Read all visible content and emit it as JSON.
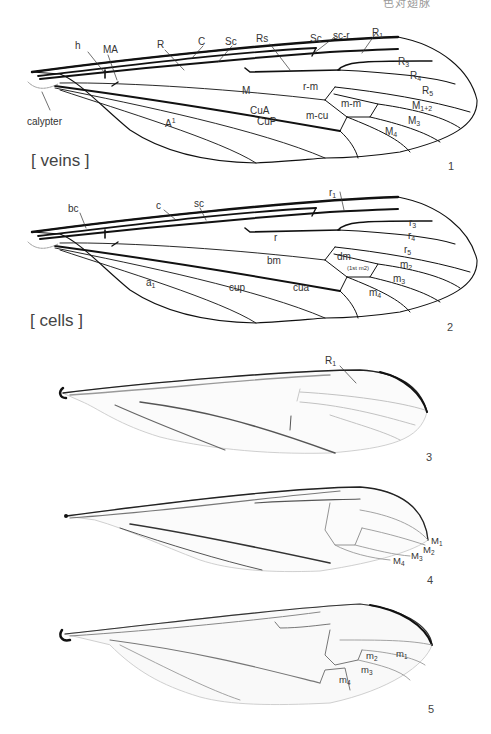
{
  "header": {
    "partial_text": "色对翅脉"
  },
  "figures": [
    {
      "number": "1",
      "section_label": "[ veins ]",
      "labels": {
        "h": "h",
        "MA": "MA",
        "R": "R",
        "C": "C",
        "Sc1": "Sc",
        "Rs": "Rs",
        "Sc2": "Sc",
        "scr": "sc-r",
        "R1": "R",
        "R1_sub": "1",
        "R3": "R",
        "R3_sub": "3",
        "R4": "R",
        "R4_sub": "4",
        "R5": "R",
        "R5_sub": "5",
        "M": "M",
        "rm": "r-m",
        "mm": "m-m",
        "M12": "M",
        "M12_sub": "1+2",
        "CuA": "CuA",
        "mcu": "m-cu",
        "M3": "M",
        "M3_sub": "3",
        "M4": "M",
        "M4_sub": "4",
        "A1": "A",
        "A1_sup": "1",
        "CuP": "CuP",
        "calypter": "calypter"
      }
    },
    {
      "number": "2",
      "section_label": "[ cells ]",
      "labels": {
        "bc": "bc",
        "c": "c",
        "sc": "sc",
        "r1": "r",
        "r1_sub": "1",
        "r3": "r",
        "r3_sub": "3",
        "r4": "r",
        "r4_sub": "4",
        "r5": "r",
        "r5_sub": "5",
        "r": "r",
        "bm": "bm",
        "dm": "dm",
        "dm_note": "(1st m2)",
        "m2": "m",
        "m2_sub": "2",
        "m3": "m",
        "m3_sub": "3",
        "m4": "m",
        "m4_sub": "4",
        "a1": "a",
        "a1_sub": "1",
        "cup": "cup",
        "cua": "cua"
      }
    },
    {
      "number": "3",
      "labels": {
        "R1": "R",
        "R1_sub": "1"
      }
    },
    {
      "number": "4",
      "labels": {
        "M1": "M",
        "M1_sub": "1",
        "M2": "M",
        "M2_sub": "2",
        "M3": "M",
        "M3_sub": "3",
        "M4": "M",
        "M4_sub": "4"
      }
    },
    {
      "number": "5",
      "labels": {
        "m1": "m",
        "m1_sub": "1",
        "m2": "m",
        "m2_sub": "2",
        "m3": "m",
        "m3_sub": "3",
        "m4": "m",
        "m4_sub": "4"
      }
    }
  ]
}
